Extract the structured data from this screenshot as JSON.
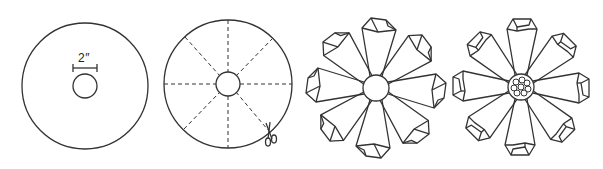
{
  "diagram": {
    "steps": [
      {
        "id": 1,
        "name": "Circle with center hole",
        "dimension_label": "2″"
      },
      {
        "id": 2,
        "name": "Circle divided into 8 segments with cut line and scissors"
      },
      {
        "id": 3,
        "name": "Folded petals flower with plain center"
      },
      {
        "id": 4,
        "name": "Folded petals flower with beaded center"
      }
    ],
    "colors": {
      "stroke": "#333333",
      "background": "#ffffff"
    }
  }
}
